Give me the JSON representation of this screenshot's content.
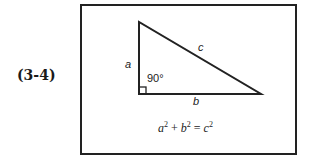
{
  "equation_number": "(3-4)",
  "triangle": {
    "side_a": "a",
    "side_b": "b",
    "side_c": "c",
    "angle": "90°"
  },
  "formula": {
    "a": "a",
    "b": "b",
    "c": "c",
    "exp": "2",
    "plus": "+",
    "equals": "="
  },
  "colors": {
    "stroke": "#222222",
    "background": "#ffffff"
  }
}
